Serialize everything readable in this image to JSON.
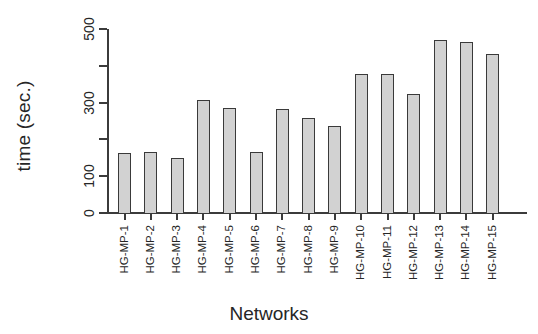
{
  "chart_data": {
    "type": "bar",
    "title": "",
    "xlabel": "Networks",
    "ylabel": "time (sec.)",
    "categories": [
      "HG-MP-1",
      "HG-MP-2",
      "HG-MP-3",
      "HG-MP-4",
      "HG-MP-5",
      "HG-MP-6",
      "HG-MP-7",
      "HG-MP-8",
      "HG-MP-9",
      "HG-MP-10",
      "HG-MP-11",
      "HG-MP-12",
      "HG-MP-13",
      "HG-MP-14",
      "HG-MP-15"
    ],
    "values": [
      163,
      166,
      150,
      307,
      285,
      165,
      283,
      258,
      236,
      378,
      378,
      323,
      470,
      465,
      432
    ],
    "ylim": [
      0,
      500
    ],
    "y_ticks": [
      0,
      100,
      200,
      300,
      400,
      500
    ],
    "y_tick_labels": [
      "0",
      "100",
      "",
      "300",
      "",
      "500"
    ],
    "grid": false,
    "legend": false,
    "bar_fill_color": "#d2d2d2",
    "bar_border_color": "#3a3a3a",
    "axis_color": "#3b3b3b",
    "background_color": "#ffffff"
  }
}
